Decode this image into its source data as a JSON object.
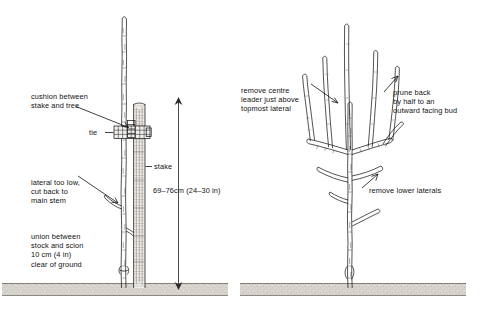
{
  "figure": {
    "background_color": "#ffffff",
    "ink_color": "#1b1b1b",
    "ground_color": "#d6d3cd"
  },
  "panel_left": {
    "name": "staking a newly planted tree",
    "labels": {
      "cushion": "cushion between\nstake and tree",
      "tie": "tie",
      "stake": "stake",
      "lateral": "lateral too low,\ncut back to\nmain stem",
      "union": "union between\nstock and scion\n10 cm (4 in)\nclear of ground",
      "dimension": "69–76cm (24–30 in)"
    }
  },
  "panel_right": {
    "name": "formative pruning of a feathered maiden",
    "labels": {
      "centre_leader": "remove centre\nleader just above\ntopmost lateral",
      "prune_back": "prune back\nby half to an\noutward facing bud",
      "lower_laterals": "remove lower laterals"
    }
  },
  "measurements": {
    "stake_height_above_ground": "69–76cm (24–30 in)",
    "union_clearance": "10 cm (4 in)"
  }
}
